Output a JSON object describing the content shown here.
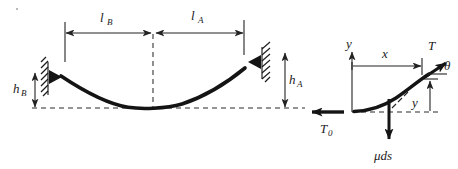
{
  "figure": {
    "ink_color": "#141414",
    "background_color": "#ffffff"
  },
  "left_diagram": {
    "name": "catenary-span-diagram",
    "labels": {
      "span_left": {
        "symbol": "l",
        "subscript": "B",
        "text": "lB"
      },
      "span_right": {
        "symbol": "l",
        "subscript": "A",
        "text": "lA"
      },
      "height_left": {
        "symbol": "h",
        "subscript": "B",
        "text": "hB"
      },
      "height_right": {
        "symbol": "h",
        "subscript": "A",
        "text": "hA"
      }
    },
    "supports": [
      {
        "name": "support-left",
        "side": "left",
        "style": "hatched-wall-pin"
      },
      {
        "name": "support-right",
        "side": "right",
        "style": "hatched-wall-pin"
      }
    ],
    "baseline": {
      "style": "dashed",
      "name": "datum-baseline"
    },
    "vertex_marker": {
      "style": "dashed",
      "name": "lowest-point-dashed-line"
    }
  },
  "right_diagram": {
    "name": "cable-element-free-body-diagram",
    "labels": {
      "axis_y": "y",
      "coord_x": "x",
      "coord_y": "y",
      "tension_end": "T",
      "tension_horizontal": {
        "symbol": "T",
        "subscript": "0",
        "text": "T0"
      },
      "angle": "θ",
      "weight": "μds"
    },
    "arrows": [
      {
        "name": "x-dimension-arrow",
        "label": "x",
        "direction": "right"
      },
      {
        "name": "y-dimension-arrow",
        "label": "y",
        "direction": "up"
      },
      {
        "name": "tension-T-arrow",
        "label": "T",
        "direction": "up-right"
      },
      {
        "name": "tension-T0-arrow",
        "label": "T0",
        "direction": "left"
      },
      {
        "name": "weight-arrow",
        "label": "μds",
        "direction": "down"
      },
      {
        "name": "y-axis-arrow",
        "label": "y",
        "direction": "up"
      }
    ]
  }
}
